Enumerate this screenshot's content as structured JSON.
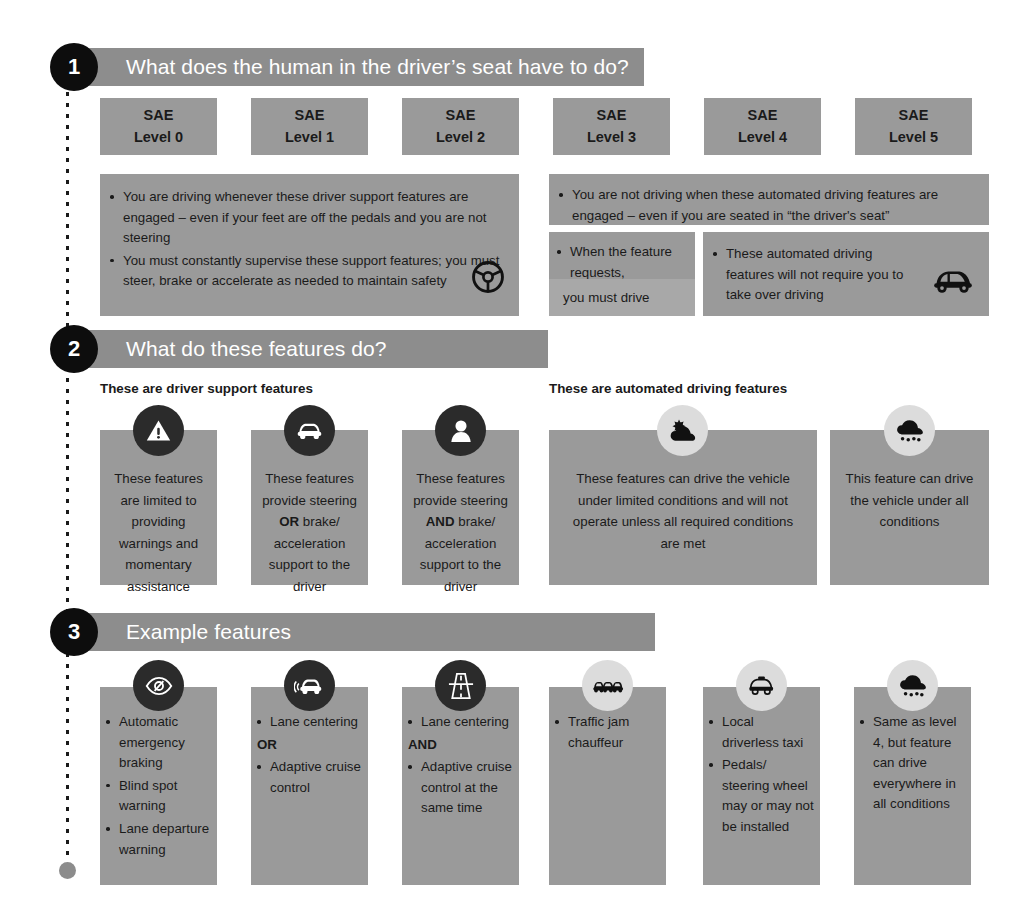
{
  "meta": {
    "colors": {
      "panel_gray": "#9a9a9a",
      "panel_light_gray": "#a8a8a8",
      "header_bar_gray": "#8d8d8d",
      "badge_dark": "#2b2b2b",
      "badge_pale": "#dcdcdc",
      "number_circle": "#0d0d0d",
      "text_dark": "#1a1a1a",
      "rail_end_dot": "#8c8c8c",
      "background": "#ffffff"
    }
  },
  "levels": [
    {
      "line1": "SAE",
      "line2": "Level 0"
    },
    {
      "line1": "SAE",
      "line2": "Level 1"
    },
    {
      "line1": "SAE",
      "line2": "Level 2"
    },
    {
      "line1": "SAE",
      "line2": "Level 3"
    },
    {
      "line1": "SAE",
      "line2": "Level 4"
    },
    {
      "line1": "SAE",
      "line2": "Level 5"
    }
  ],
  "section1": {
    "number": "1",
    "title": "What does the human in the driver’s seat have to do?",
    "support_bullets": [
      "You are driving whenever these driver support features are engaged – even if your feet are off the pedals and you are not steering",
      "You must constantly supervise these support features; you must steer, brake or accelerate as needed to maintain safety"
    ],
    "support_icon": "steering-wheel-icon",
    "automated_bullets": [
      "You are not driving when these automated driving features are engaged – even if you are seated in “the driver's seat”"
    ],
    "level3_bullet": "When the feature requests,",
    "level3_emphasis": "you must drive",
    "level45_bullet": "These automated driving features will not require you to take over driving",
    "level45_icon": "car-icon"
  },
  "section2": {
    "number": "2",
    "title": "What do these features do?",
    "subhead_left": "These are driver support features",
    "subhead_right": "These are automated driving features",
    "cards": [
      {
        "icon": "warning-triangle-icon",
        "icon_style": "dark",
        "text_parts": [
          {
            "text": "These features are limited to providing warnings and momentary assistance",
            "bold": false
          }
        ]
      },
      {
        "icon": "car-front-icon",
        "icon_style": "dark",
        "text_parts": [
          {
            "text": "These features provide steering ",
            "bold": false
          },
          {
            "text": "OR",
            "bold": true
          },
          {
            "text": " brake/ acceleration support to the driver",
            "bold": false
          }
        ]
      },
      {
        "icon": "person-icon",
        "icon_style": "dark",
        "text_parts": [
          {
            "text": "These features provide steering ",
            "bold": false
          },
          {
            "text": "AND",
            "bold": true
          },
          {
            "text": " brake/ acceleration support to the driver",
            "bold": false
          }
        ]
      },
      {
        "icon": "sun-behind-cloud-icon",
        "icon_style": "pale",
        "text_parts": [
          {
            "text": "These features can drive the vehicle under limited conditions and will not operate unless all required conditions are met",
            "bold": false
          }
        ]
      },
      {
        "icon": "snow-cloud-icon",
        "icon_style": "pale",
        "text_parts": [
          {
            "text": "This feature can drive the vehicle under all conditions",
            "bold": false
          }
        ]
      }
    ]
  },
  "section3": {
    "number": "3",
    "title": "Example features",
    "cards": [
      {
        "icon": "eye-slash-icon",
        "icon_style": "dark",
        "bullets": [
          "Automatic emergency braking",
          "Blind spot warning",
          "Lane departure warning"
        ],
        "connector": null,
        "bullets2": []
      },
      {
        "icon": "car-sensing-icon",
        "icon_style": "dark",
        "bullets": [
          "Lane centering"
        ],
        "connector": "OR",
        "bullets2": [
          "Adaptive cruise control"
        ]
      },
      {
        "icon": "highway-icon",
        "icon_style": "dark",
        "bullets": [
          "Lane centering"
        ],
        "connector": "AND",
        "bullets2": [
          "Adaptive cruise control at the same time"
        ]
      },
      {
        "icon": "traffic-jam-icon",
        "icon_style": "pale",
        "bullets": [
          "Traffic jam chauffeur"
        ],
        "connector": null,
        "bullets2": []
      },
      {
        "icon": "taxi-icon",
        "icon_style": "pale",
        "bullets": [
          "Local driverless taxi",
          "Pedals/ steering wheel may or may not be installed"
        ],
        "connector": null,
        "bullets2": []
      },
      {
        "icon": "snow-cloud-icon",
        "icon_style": "pale",
        "bullets": [
          "Same as level 4, but feature can drive everywhere in all conditions"
        ],
        "connector": null,
        "bullets2": []
      }
    ]
  }
}
